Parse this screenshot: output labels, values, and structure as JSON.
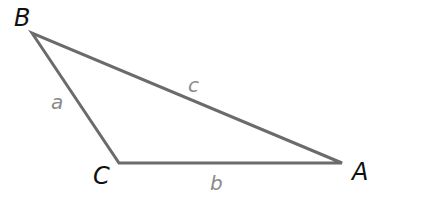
{
  "diagram": {
    "type": "triangle",
    "colors": {
      "edge": "#6b6b6b",
      "vertex_label": "#111111",
      "side_label": "#8a8a8a",
      "background": "#ffffff"
    },
    "vertices": [
      {
        "id": "B",
        "label": "B",
        "x": 32,
        "y": 33,
        "label_x": 14,
        "label_y": 26
      },
      {
        "id": "C",
        "label": "C",
        "x": 119,
        "y": 163,
        "label_x": 93,
        "label_y": 184
      },
      {
        "id": "A",
        "label": "A",
        "x": 342,
        "y": 163,
        "label_x": 352,
        "label_y": 180
      }
    ],
    "sides": [
      {
        "id": "a",
        "label": "a",
        "from": "B",
        "to": "C",
        "label_x": 51,
        "label_y": 109
      },
      {
        "id": "b",
        "label": "b",
        "from": "C",
        "to": "A",
        "label_x": 210,
        "label_y": 190
      },
      {
        "id": "c",
        "label": "c",
        "from": "B",
        "to": "A",
        "label_x": 188,
        "label_y": 92
      }
    ]
  }
}
